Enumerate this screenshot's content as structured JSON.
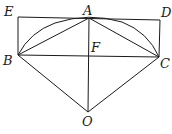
{
  "diagram": {
    "type": "geometry",
    "points": {
      "E": {
        "label": "E",
        "x": 18,
        "y": 17
      },
      "A": {
        "label": "A",
        "x": 89,
        "y": 18
      },
      "D": {
        "label": "D",
        "x": 160,
        "y": 20
      },
      "B": {
        "label": "B",
        "x": 18,
        "y": 55
      },
      "F": {
        "label": "F",
        "x": 89,
        "y": 56
      },
      "C": {
        "label": "C",
        "x": 159,
        "y": 57
      },
      "O": {
        "label": "O",
        "x": 88,
        "y": 112
      }
    },
    "segments": [
      "ED",
      "EB",
      "DC",
      "BC",
      "AB",
      "AC",
      "AO",
      "OB",
      "OC"
    ],
    "arcs": [
      "BAC"
    ],
    "stroke_color": "#1a1a1a"
  }
}
